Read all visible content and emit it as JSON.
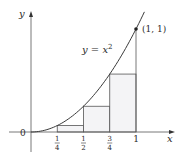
{
  "figure": {
    "axes": {
      "x_label": "x",
      "y_label": "y",
      "origin_label": "0"
    },
    "curve": {
      "label_main": "y = x",
      "label_exp": "2",
      "function": "x^2",
      "domain": [
        0,
        1.08
      ]
    },
    "point": {
      "label": "(1, 1)",
      "x": 1,
      "y": 1
    },
    "ticks": [
      {
        "value": 0.25,
        "num": "1",
        "den": "4"
      },
      {
        "value": 0.5,
        "num": "1",
        "den": "2"
      },
      {
        "value": 0.75,
        "num": "3",
        "den": "4"
      },
      {
        "value": 1,
        "label": "1"
      }
    ],
    "rectangles": [
      {
        "x0": 0.25,
        "x1": 0.5,
        "height": 0.0625
      },
      {
        "x0": 0.5,
        "x1": 0.75,
        "height": 0.25
      },
      {
        "x0": 0.75,
        "x1": 1.0,
        "height": 0.5625
      }
    ],
    "colors": {
      "line": "#3a3a3a",
      "fill": "#f4f4f6",
      "axis": "#555555"
    }
  }
}
